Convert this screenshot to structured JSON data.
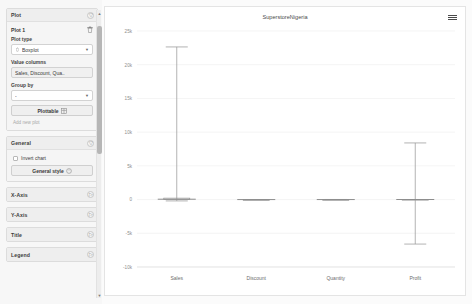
{
  "sidebar": {
    "plot_section": {
      "title": "Plot",
      "collapse_icon": "chevron-collapse-icon",
      "plot_name": "Plot 1",
      "delete_icon": "trash-icon",
      "plot_type_label": "Plot type",
      "plot_type_value": "Boxplot",
      "value_columns_label": "Value columns",
      "value_columns_value": "Sales, Discount, Qua..",
      "group_by_label": "Group by",
      "group_by_value": "-",
      "plottable_button": "Plottable",
      "add_plot_link": "Add new plot"
    },
    "general_section": {
      "title": "General",
      "invert_chart_label": "Invert chart",
      "general_style_button": "General style"
    },
    "collapsed_sections": [
      {
        "title": "X-Axis"
      },
      {
        "title": "Y-Axis"
      },
      {
        "title": "Title"
      },
      {
        "title": "Legend"
      }
    ]
  },
  "chart_header": {
    "menu_icon": "hamburger-menu-icon"
  },
  "chart_data": {
    "type": "box",
    "title": "SuperstoreNigeria",
    "xlabel": "",
    "ylabel": "",
    "categories": [
      "Sales",
      "Discount",
      "Quantity",
      "Profit"
    ],
    "ytick_labels": [
      "25k",
      "20k",
      "15k",
      "10k",
      "5k",
      "0",
      "-5k",
      "-10k"
    ],
    "ytick_values": [
      25000,
      20000,
      15000,
      10000,
      5000,
      0,
      -5000,
      -10000
    ],
    "ylim": [
      -10000,
      25000
    ],
    "grid": true,
    "legend": false,
    "series": [
      {
        "name": "Sales",
        "min": -200,
        "q1": 17,
        "median": 54,
        "q3": 210,
        "max": 22638
      },
      {
        "name": "Discount",
        "min": 0,
        "q1": 0,
        "median": 0.2,
        "q3": 0.2,
        "max": 0.8
      },
      {
        "name": "Quantity",
        "min": 1,
        "q1": 2,
        "median": 3,
        "q3": 5,
        "max": 14
      },
      {
        "name": "Profit",
        "min": -6600,
        "q1": 1.7,
        "median": 8.7,
        "q3": 29,
        "max": 8400
      }
    ]
  }
}
